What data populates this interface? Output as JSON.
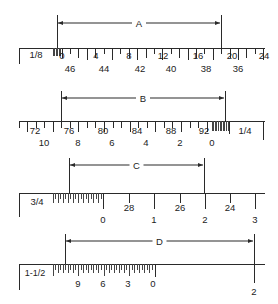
{
  "colors": {
    "line": "#2a2a2a",
    "background": "#ffffff"
  },
  "scales": [
    {
      "id": "A",
      "dimension_label": "A",
      "scale_label": "1/8",
      "upper_numbers": [
        "0",
        "4",
        "8",
        "12",
        "16",
        "20",
        "24"
      ],
      "lower_numbers": [
        "46",
        "44",
        "42",
        "40",
        "38",
        "36"
      ]
    },
    {
      "id": "B",
      "dimension_label": "B",
      "scale_label": "1/4",
      "upper_numbers": [
        "72",
        "76",
        "80",
        "84",
        "88",
        "92"
      ],
      "lower_numbers": [
        "10",
        "8",
        "6",
        "4",
        "2",
        "0"
      ]
    },
    {
      "id": "C",
      "dimension_label": "C",
      "scale_label": "3/4",
      "upper_numbers": [
        "28",
        "26",
        "24"
      ],
      "lower_numbers": [
        "0",
        "1",
        "2",
        "3"
      ]
    },
    {
      "id": "D",
      "dimension_label": "D",
      "scale_label": "1-1/2",
      "fine_numbers": [
        "9",
        "6",
        "3",
        "0"
      ],
      "lower_numbers": [
        "2"
      ]
    }
  ]
}
